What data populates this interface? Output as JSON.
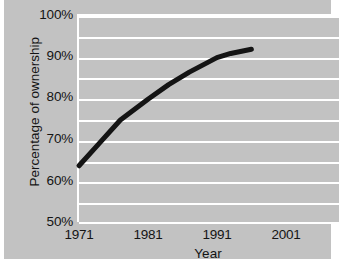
{
  "chart_data": {
    "type": "line",
    "title": "",
    "xlabel": "Year",
    "ylabel": "Percentage of ownership",
    "xlim": [
      1971,
      2009
    ],
    "ylim": [
      50,
      100
    ],
    "x_ticks": [
      1971,
      1981,
      1991,
      2001
    ],
    "x_tick_labels": [
      "1971",
      "1981",
      "1991",
      "2001"
    ],
    "y_ticks": [
      50,
      60,
      70,
      80,
      90,
      100
    ],
    "y_tick_labels": [
      "50%",
      "60%",
      "70%",
      "80%",
      "90%",
      "100%"
    ],
    "gridlines": {
      "visible": true,
      "axis": "y",
      "color": "#ffffff",
      "interval": 5,
      "values": [
        55,
        60,
        65,
        70,
        75,
        80,
        85,
        90,
        95,
        100
      ]
    },
    "legend": {
      "visible": false,
      "position": "none"
    },
    "series": [
      {
        "name": "Percentage of ownership",
        "color": "#141414",
        "line_width": 5,
        "x": [
          1971,
          1974,
          1977,
          1981,
          1984,
          1987,
          1991,
          1993,
          1996
        ],
        "values": [
          64,
          69.5,
          75,
          80,
          83.5,
          86.5,
          90,
          91,
          92
        ]
      }
    ],
    "background_color": "#c2c2c2",
    "plot_border_color": "#ffffff"
  },
  "axes": {
    "y_labels": [
      "100%",
      "90%",
      "80%",
      "70%",
      "60%",
      "50%"
    ],
    "x_labels": [
      "1971",
      "1981",
      "1991",
      "2001"
    ],
    "x_title": "Year",
    "y_title": "Percentage of ownership"
  },
  "artifact": {
    "top_left_mark": ""
  }
}
